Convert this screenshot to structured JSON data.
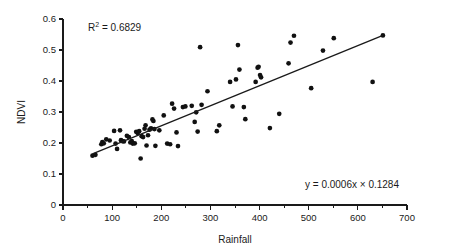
{
  "chart_data": {
    "type": "scatter",
    "title": "",
    "xlabel": "Rainfall",
    "ylabel": "NDVI",
    "xlim": [
      0,
      700
    ],
    "ylim": [
      0,
      0.6
    ],
    "x_ticks": [
      0,
      100,
      200,
      300,
      400,
      500,
      600,
      700
    ],
    "x_tick_labels": [
      "0",
      "100",
      "200",
      "300",
      "400",
      "500",
      "600",
      "700"
    ],
    "x_minor_ticks": [
      50,
      150,
      250,
      350,
      450,
      550,
      650
    ],
    "y_ticks": [
      0,
      0.1,
      0.2,
      0.3,
      0.4,
      0.5,
      0.6
    ],
    "y_tick_labels": [
      "0",
      "0.1",
      "0.2",
      "0.3",
      "0.4",
      "0.5",
      "0.6"
    ],
    "grid": false,
    "legend": false,
    "point_color": "#111111",
    "line_color": "#1a1a1a",
    "points": [
      [
        60,
        0.159
      ],
      [
        66,
        0.162
      ],
      [
        78,
        0.196
      ],
      [
        80,
        0.203
      ],
      [
        83,
        0.199
      ],
      [
        88,
        0.212
      ],
      [
        95,
        0.208
      ],
      [
        104,
        0.239
      ],
      [
        107,
        0.198
      ],
      [
        110,
        0.181
      ],
      [
        116,
        0.241
      ],
      [
        118,
        0.209
      ],
      [
        121,
        0.206
      ],
      [
        124,
        0.205
      ],
      [
        130,
        0.223
      ],
      [
        134,
        0.219
      ],
      [
        137,
        0.202
      ],
      [
        140,
        0.206
      ],
      [
        142,
        0.198
      ],
      [
        146,
        0.199
      ],
      [
        149,
        0.236
      ],
      [
        152,
        0.232
      ],
      [
        155,
        0.238
      ],
      [
        158,
        0.15
      ],
      [
        160,
        0.222
      ],
      [
        163,
        0.219
      ],
      [
        166,
        0.246
      ],
      [
        168,
        0.257
      ],
      [
        170,
        0.192
      ],
      [
        173,
        0.225
      ],
      [
        176,
        0.243
      ],
      [
        179,
        0.247
      ],
      [
        182,
        0.276
      ],
      [
        184,
        0.271
      ],
      [
        186,
        0.245
      ],
      [
        188,
        0.191
      ],
      [
        196,
        0.241
      ],
      [
        205,
        0.289
      ],
      [
        212,
        0.198
      ],
      [
        218,
        0.196
      ],
      [
        222,
        0.327
      ],
      [
        226,
        0.311
      ],
      [
        231,
        0.234
      ],
      [
        234,
        0.19
      ],
      [
        244,
        0.316
      ],
      [
        249,
        0.318
      ],
      [
        262,
        0.32
      ],
      [
        268,
        0.268
      ],
      [
        271,
        0.299
      ],
      [
        274,
        0.237
      ],
      [
        279,
        0.509
      ],
      [
        282,
        0.323
      ],
      [
        294,
        0.367
      ],
      [
        313,
        0.238
      ],
      [
        318,
        0.257
      ],
      [
        340,
        0.397
      ],
      [
        345,
        0.318
      ],
      [
        352,
        0.405
      ],
      [
        356,
        0.516
      ],
      [
        359,
        0.437
      ],
      [
        368,
        0.316
      ],
      [
        371,
        0.277
      ],
      [
        392,
        0.397
      ],
      [
        396,
        0.443
      ],
      [
        398,
        0.446
      ],
      [
        401,
        0.419
      ],
      [
        403,
        0.412
      ],
      [
        421,
        0.248
      ],
      [
        440,
        0.294
      ],
      [
        459,
        0.457
      ],
      [
        463,
        0.524
      ],
      [
        470,
        0.546
      ],
      [
        505,
        0.377
      ],
      [
        529,
        0.498
      ],
      [
        551,
        0.538
      ],
      [
        630,
        0.397
      ],
      [
        651,
        0.547
      ]
    ],
    "trend_line": {
      "x_start": 60,
      "y_start": 0.165,
      "x_end": 651,
      "y_end": 0.547,
      "equation_label": "y = 0.0006x × 0.1284"
    },
    "annotations": {
      "r_squared": {
        "prefix": "R",
        "superscript": "2",
        "suffix": " = 0.6829"
      },
      "equation": "y = 0.0006x × 0.1284"
    }
  }
}
